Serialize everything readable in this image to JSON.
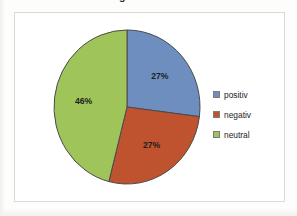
{
  "caption": {
    "text": "da werden als neutral gewertet."
  },
  "chart_data": {
    "type": "pie",
    "title": "",
    "subtitle": "",
    "xlabel": "",
    "ylabel": "",
    "grid": false,
    "legend_position": "right",
    "start_angle_deg": 0,
    "direction": "clockwise",
    "categories": [
      "positiv",
      "negativ",
      "neutral"
    ],
    "values": [
      27,
      27,
      46
    ],
    "value_unit": "%",
    "data_labels": [
      "27%",
      "27%",
      "46%"
    ],
    "colors": [
      "#6E8EBF",
      "#C0532F",
      "#9FC45A"
    ],
    "border_color": "#4a4a4a",
    "legend": [
      {
        "label": "positiv",
        "color": "#6E8EBF"
      },
      {
        "label": "negativ",
        "color": "#C0532F"
      },
      {
        "label": "neutral",
        "color": "#9FC45A"
      }
    ]
  },
  "frame": {
    "border_color": "#d7d9dc",
    "background": "#ffffff"
  }
}
